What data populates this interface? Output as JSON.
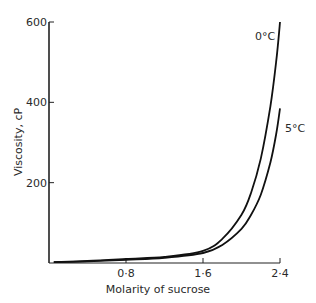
{
  "chart_data": {
    "type": "line",
    "title": "",
    "xlabel": "Molarity of sucrose",
    "ylabel": "Viscosity, cP",
    "xlim": [
      0,
      2.4
    ],
    "ylim": [
      0,
      600
    ],
    "x_ticks": [
      0.8,
      1.6,
      2.4
    ],
    "x_tick_labels": [
      "0·8",
      "1·6",
      "2·4"
    ],
    "y_ticks": [
      200,
      400,
      600
    ],
    "y_tick_labels": [
      "200",
      "400",
      "600"
    ],
    "grid": false,
    "legend": "inline labels at curve ends",
    "series": [
      {
        "name": "0°C",
        "label": "0°C",
        "x": [
          0.05,
          0.4,
          0.8,
          1.2,
          1.6,
          1.8,
          2.0,
          2.1,
          2.2,
          2.3,
          2.36,
          2.4
        ],
        "y": [
          2,
          5,
          10,
          15,
          30,
          60,
          120,
          175,
          260,
          390,
          500,
          600
        ]
      },
      {
        "name": "5°C",
        "label": "5°C",
        "x": [
          0.05,
          0.4,
          0.8,
          1.2,
          1.6,
          1.8,
          2.0,
          2.1,
          2.2,
          2.3,
          2.36,
          2.4
        ],
        "y": [
          2,
          4,
          8,
          13,
          25,
          45,
          85,
          120,
          170,
          250,
          320,
          385
        ]
      }
    ]
  },
  "colors": {
    "line": "#111111",
    "axis": "#222222",
    "background": "#ffffff"
  }
}
